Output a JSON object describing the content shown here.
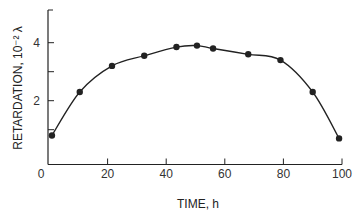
{
  "chart_data": {
    "type": "scatter",
    "title": "",
    "xlabel": "TIME, h",
    "ylabel": "RETARDATION, 10⁻² λ",
    "xlim": [
      0,
      100
    ],
    "ylim": [
      0,
      5
    ],
    "x_ticks": [
      0,
      20,
      40,
      60,
      80,
      100
    ],
    "y_ticks": [
      0,
      2,
      4
    ],
    "y_minor_ticks": [
      1,
      3
    ],
    "grid": false,
    "legend": null,
    "series": [
      {
        "name": "measured",
        "marker": "filled-circle",
        "fit_curve": true,
        "x": [
          1,
          10.5,
          21.5,
          32.5,
          43.5,
          50.5,
          56,
          68,
          79,
          90,
          99
        ],
        "y": [
          0.8,
          2.3,
          3.2,
          3.55,
          3.85,
          3.9,
          3.8,
          3.6,
          3.4,
          2.3,
          0.7
        ]
      }
    ]
  },
  "colors": {
    "ink": "#222222",
    "background": "#ffffff"
  }
}
